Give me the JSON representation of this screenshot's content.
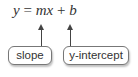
{
  "equation": {
    "y": "y",
    "equals": "=",
    "m": "m",
    "x": "x",
    "plus": "+",
    "b": "b"
  },
  "labels": {
    "slope": "slope",
    "intercept": "y-intercept"
  }
}
